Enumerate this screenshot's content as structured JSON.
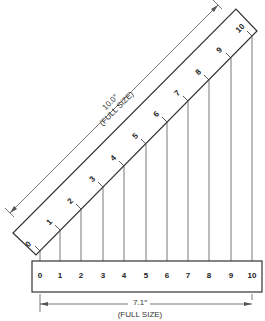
{
  "diagram": {
    "inclined_scale": {
      "tick_labels": [
        "0",
        "1",
        "2",
        "3",
        "4",
        "5",
        "6",
        "7",
        "8",
        "9",
        "10"
      ],
      "dimension_value": "10.0″",
      "dimension_note": "(FULL SIZE)"
    },
    "horizontal_scale": {
      "tick_labels": [
        "0",
        "1",
        "2",
        "3",
        "4",
        "5",
        "6",
        "7",
        "8",
        "9",
        "10"
      ],
      "dimension_value": "7.1″",
      "dimension_note": "(FULL SIZE)"
    },
    "colors": {
      "line": "#333333",
      "text": "#222222",
      "background": "#ffffff"
    }
  }
}
